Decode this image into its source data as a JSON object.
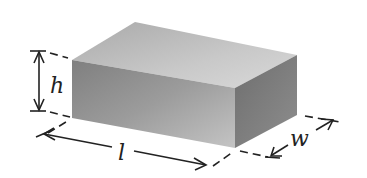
{
  "diagram": {
    "labels": {
      "height": "h",
      "length": "l",
      "width": "w"
    },
    "colors": {
      "top_face": "#bdbdbd",
      "front_face": "#9a9a9a",
      "right_face": "#7d7d7d",
      "line": "#222222",
      "background": "#ffffff"
    }
  }
}
